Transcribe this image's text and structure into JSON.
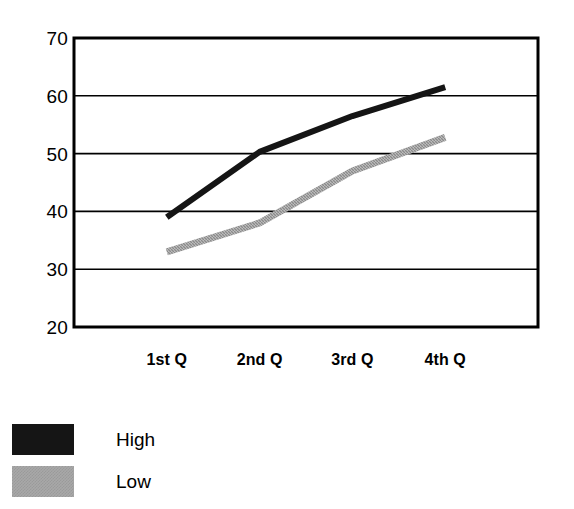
{
  "chart_data": {
    "type": "line",
    "title": "",
    "subtitle": "",
    "xlabel": "",
    "ylabel": "",
    "categories": [
      "1st Q",
      "2nd Q",
      "3rd Q",
      "4th Q"
    ],
    "series": [
      {
        "name": "High",
        "values": [
          39,
          50.3,
          56.5,
          61.5
        ],
        "color": "#151515"
      },
      {
        "name": "Low",
        "values": [
          33,
          38,
          47,
          52.8
        ],
        "color": "#a8a8a8"
      }
    ],
    "ylim": [
      20,
      70
    ],
    "yticks": [
      20,
      30,
      40,
      50,
      60,
      70
    ],
    "ytick_labels": [
      "20",
      "30",
      "40",
      "50",
      "60",
      "70"
    ],
    "grid": "horizontal",
    "legend_position": "below-left"
  },
  "legend": {
    "items": [
      {
        "label": "High",
        "swatch": "black-swatch"
      },
      {
        "label": "Low",
        "swatch": "gray-swatch"
      }
    ]
  },
  "colors": {
    "high": "#151515",
    "low": "#a8a8a8",
    "axis": "#000000",
    "grid": "#000000",
    "background": "#ffffff"
  }
}
